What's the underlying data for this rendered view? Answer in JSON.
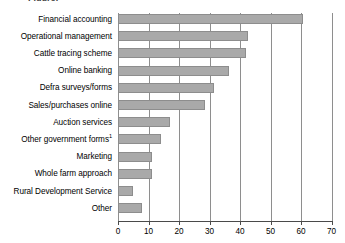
{
  "title_fragment": "Figure:",
  "chart_data": {
    "type": "bar",
    "orientation": "horizontal",
    "title": "",
    "xlabel": "",
    "ylabel": "",
    "xlim": [
      0,
      70
    ],
    "xticks": [
      0,
      10,
      20,
      30,
      40,
      50,
      60,
      70
    ],
    "grid": "vertical",
    "legend": "none",
    "bar_color": "#a9a9a9",
    "bar_border_color": "#8d8d8d",
    "axis_color": "#4a4a4a",
    "gridline_color": "#8e8e8e",
    "categories": [
      "Financial accounting",
      "Operational management",
      "Cattle tracing scheme",
      "Online banking",
      "Defra surveys/forms",
      "Sales/purchases online",
      "Auction services",
      "Other government forms",
      "Marketing",
      "Whole farm approach",
      "Rural Development Service",
      "Other"
    ],
    "category_footnotes": [
      "",
      "",
      "",
      "",
      "",
      "",
      "",
      "1",
      "",
      "",
      "",
      ""
    ],
    "values": [
      60.5,
      42.5,
      42,
      36.5,
      31.5,
      28.5,
      17,
      14,
      11,
      11,
      5,
      8
    ]
  }
}
